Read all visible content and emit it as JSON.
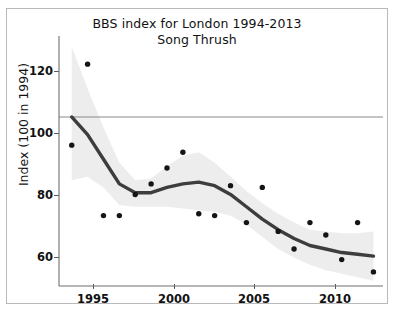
{
  "chart_data": {
    "type": "scatter",
    "title": "BBS index for London 1994-2013",
    "subtitle": "Song Thrush",
    "xlabel": "",
    "ylabel": "Index (100 in 1994)",
    "xlim": [
      1993.2,
      2013.6
    ],
    "ylim": [
      52,
      123
    ],
    "grid": false,
    "legend": false,
    "xticks": [
      1995,
      2000,
      2005,
      2010
    ],
    "yticks": [
      60,
      80,
      100,
      120
    ],
    "x": [
      1994,
      1995,
      1996,
      1997,
      1998,
      1999,
      2000,
      2001,
      2002,
      2003,
      2004,
      2005,
      2006,
      2007,
      2008,
      2009,
      2010,
      2011,
      2012,
      2013
    ],
    "series": [
      {
        "name": "Annual index",
        "marker": "filled-circle",
        "color": "#151515",
        "values": [
          92,
          115,
          72,
          72,
          78,
          81,
          85.5,
          90,
          72.5,
          72,
          80.5,
          70,
          80,
          67.5,
          62.5,
          70,
          66.5,
          59.5,
          70,
          56
        ]
      },
      {
        "name": "Smoothed trend",
        "marker": "line",
        "color": "#3d3d3d",
        "values": [
          100,
          95,
          88,
          81,
          78.5,
          78.5,
          80,
          81,
          81.5,
          80.5,
          78,
          74.5,
          71,
          68,
          65.5,
          63.5,
          62.5,
          61.5,
          61,
          60.5
        ]
      }
    ],
    "confidence_band": {
      "name": "95% confidence interval",
      "color": "#ededed",
      "upper": [
        120,
        108,
        97,
        87,
        82,
        82.5,
        86,
        89,
        90,
        87,
        83,
        79,
        75.5,
        72.5,
        70,
        68,
        67.5,
        67,
        67,
        67.5
      ],
      "lower": [
        82,
        83,
        80,
        75,
        74.5,
        74.5,
        74.5,
        74,
        73.5,
        73,
        72,
        69.5,
        66,
        62.5,
        60,
        58,
        56.5,
        55.5,
        54.5,
        53.5
      ]
    },
    "reference_line": {
      "name": "baseline-100",
      "value": 100,
      "color": "#8a8a8a"
    }
  },
  "axes": {
    "ytick_labels": [
      "120",
      "100",
      "80",
      "60"
    ],
    "xtick_labels": [
      "1995",
      "2000",
      "2005",
      "2010"
    ]
  },
  "footer": {
    "caption": ""
  }
}
